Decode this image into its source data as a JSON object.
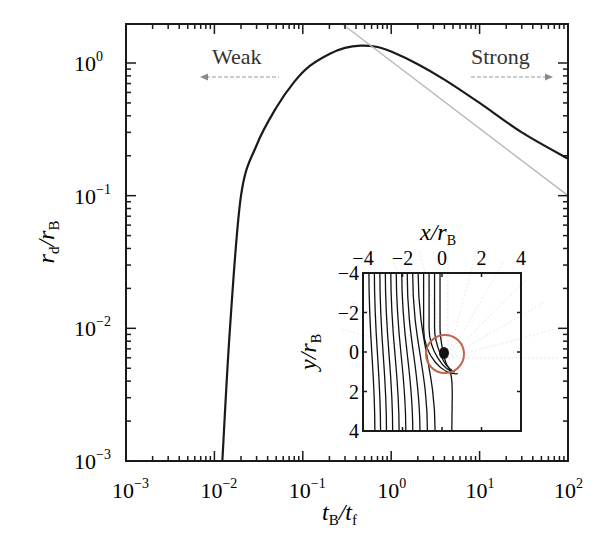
{
  "chart_data": {
    "type": "line",
    "title": "",
    "xlabel": "t_B/t_f",
    "ylabel": "r_d/r_B",
    "xscale": "log",
    "yscale": "log",
    "xlim": [
      0.001,
      100
    ],
    "ylim": [
      0.001,
      2
    ],
    "grid": false,
    "x_ticks": [
      "10^-3",
      "10^-2",
      "10^-1",
      "10^0",
      "10^1",
      "10^2"
    ],
    "y_ticks": [
      "10^-3",
      "10^-2",
      "10^-1",
      "10^0"
    ],
    "series": [
      {
        "name": "r_d/r_B",
        "color": "#1a1a1a",
        "style": "solid",
        "x": [
          0.0123,
          0.015,
          0.02,
          0.03,
          0.05,
          0.08,
          0.12,
          0.2,
          0.3,
          0.45,
          0.7,
          1.0,
          2.0,
          4.0,
          10.0,
          30.0,
          100.0
        ],
        "y": [
          0.001,
          0.01,
          0.1,
          0.24,
          0.46,
          0.72,
          0.95,
          1.17,
          1.3,
          1.35,
          1.32,
          1.22,
          0.98,
          0.75,
          0.5,
          0.3,
          0.19
        ]
      },
      {
        "name": "power-law asymptote",
        "color": "#b8b8b8",
        "style": "solid",
        "x": [
          0.28,
          100.0
        ],
        "y": [
          2.0,
          0.1
        ]
      }
    ],
    "annotations": [
      {
        "text": "Weak",
        "arrow": "left",
        "x_range": [
          0.008,
          0.1
        ],
        "y": 0.7
      },
      {
        "text": "Strong",
        "arrow": "right",
        "x_range": [
          10,
          60
        ],
        "y": 0.7
      }
    ],
    "inset": {
      "type": "streamlines",
      "xlabel": "x/r_B",
      "ylabel": "y/r_B",
      "x_ticks": [
        "-4",
        "-2",
        "0",
        "2",
        "4"
      ],
      "y_ticks": [
        "-4",
        "-2",
        "0",
        "2",
        "4"
      ],
      "xlim": [
        -4,
        4
      ],
      "ylim": [
        -4,
        4
      ],
      "y_inverted": true,
      "x_axis_position": "top",
      "circle": {
        "cx": 0.3,
        "cy": 0.3,
        "r": 1.1,
        "color": "#c0664a"
      },
      "streamline_count": 14
    }
  },
  "labels": {
    "weak": "Weak",
    "strong": "Strong",
    "x_title_main": "t",
    "x_title_sub1": "B",
    "x_title_slash": "/t",
    "x_title_sub2": "f",
    "y_title_main": "r",
    "y_title_sub1": "d",
    "y_title_slash": "/r",
    "y_title_sub2": "B",
    "inset_x_main": "x/r",
    "inset_x_sub": "B",
    "inset_y_main": "y/r",
    "inset_y_sub": "B"
  },
  "colors": {
    "axis": "#1a1a1a",
    "curve": "#1a1a1a",
    "asymptote": "#b8b8b8",
    "arrow": "#9a9a9a",
    "circle": "#c0664a"
  }
}
